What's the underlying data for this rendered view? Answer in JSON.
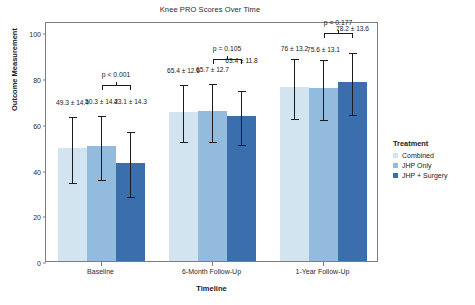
{
  "chart_data": {
    "type": "bar",
    "title": "Knee PRO Scores Over Time",
    "xlabel": "Timeline",
    "ylabel": "Outcome Measurement",
    "ylim": [
      0,
      105
    ],
    "yticks": [
      0,
      20,
      40,
      60,
      80,
      100
    ],
    "grid": false,
    "legend_position": "right",
    "legend_title": "Treatment",
    "categories": [
      "Baseline",
      "6-Month Follow-Up",
      "1-Year Follow-Up"
    ],
    "series": [
      {
        "name": "Combined",
        "color": "#d3e4f1",
        "values": [
          49.3,
          65.4,
          76
        ],
        "errors": [
          14.4,
          12.6,
          13.2
        ],
        "labels": [
          "49.3 ± 14.4",
          "65.4 ± 12.6",
          "76 ± 13.2"
        ]
      },
      {
        "name": "JHP Only",
        "color": "#92bbdd",
        "values": [
          50.3,
          65.7,
          75.6
        ],
        "errors": [
          14.2,
          12.7,
          13.1
        ],
        "labels": [
          "50.3 ± 14.2",
          "65.7 ± 12.7",
          "75.6 ± 13.1"
        ]
      },
      {
        "name": "JHP + Surgery",
        "color": "#3a6ead",
        "values": [
          43.1,
          63.4,
          78.2
        ],
        "errors": [
          14.3,
          11.8,
          13.6
        ],
        "labels": [
          "43.1 ± 14.3",
          "63.4 ± 11.8",
          "78.2 ± 13.6"
        ]
      }
    ],
    "annotations": [
      {
        "group": "Baseline",
        "text": "p < 0.001"
      },
      {
        "group": "6-Month Follow-Up",
        "text": "p = 0.105"
      },
      {
        "group": "1-Year Follow-Up",
        "text": "p = 0.177"
      }
    ]
  },
  "axis": {
    "ytick_labels": [
      "0",
      "20",
      "40",
      "60",
      "80",
      "100"
    ],
    "xtick_labels": [
      "Baseline",
      "6-Month Follow-Up",
      "1-Year Follow-Up"
    ]
  }
}
